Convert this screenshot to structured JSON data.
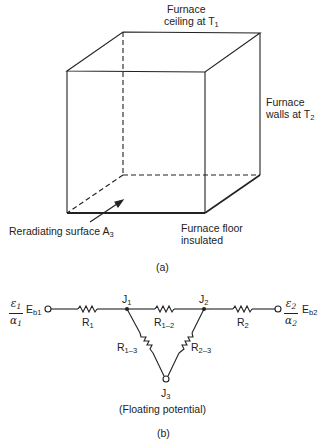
{
  "part_a": {
    "ceiling_label_line1": "Furnace",
    "ceiling_label_line2": "ceiling at T",
    "ceiling_sub": "1",
    "walls_label_line1": "Furnace",
    "walls_label_line2": "walls at T",
    "walls_sub": "2",
    "reradiating_label": "Reradiating surface A",
    "reradiating_sub": "3",
    "floor_label_line1": "Furnace floor",
    "floor_label_line2": "insulated",
    "caption": "(a)"
  },
  "part_b": {
    "left_source": {
      "num": "ε",
      "num_sub": "1",
      "den": "α",
      "den_sub": "1",
      "label": "E",
      "label_sub": "b1"
    },
    "right_source": {
      "num": "ε",
      "num_sub": "2",
      "den": "α",
      "den_sub": "2",
      "label": "E",
      "label_sub": "b2"
    },
    "resistors": {
      "r1": {
        "label": "R",
        "sub": "1"
      },
      "r12": {
        "label": "R",
        "sub": "1–2"
      },
      "r2": {
        "label": "R",
        "sub": "2"
      },
      "r13": {
        "label": "R",
        "sub": "1–3"
      },
      "r23": {
        "label": "R",
        "sub": "2–3"
      }
    },
    "junctions": {
      "j1": {
        "label": "J",
        "sub": "1"
      },
      "j2": {
        "label": "J",
        "sub": "2"
      },
      "j3": {
        "label": "J",
        "sub": "3"
      }
    },
    "floating_label": "(Floating potential)",
    "caption": "(b)"
  }
}
